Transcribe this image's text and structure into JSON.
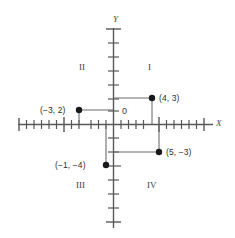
{
  "diagram": {
    "type": "cartesian-coordinate-plane",
    "axes": {
      "x_label": "X",
      "y_label": "Y",
      "origin_label": "0"
    },
    "quadrants": [
      {
        "id": "I",
        "label": "I"
      },
      {
        "id": "II",
        "label": "II"
      },
      {
        "id": "III",
        "label": "III"
      },
      {
        "id": "IV",
        "label": "IV"
      }
    ],
    "points": [
      {
        "label": "(4, 3)",
        "x": 4,
        "y": 3
      },
      {
        "label": "(−3, 2)",
        "x": -3,
        "y": 2
      },
      {
        "label": "(−1, −4)",
        "x": -1,
        "y": -4
      },
      {
        "label": "(5, −3)",
        "x": 5,
        "y": -3
      }
    ],
    "colors": {
      "axis": "#58585a",
      "leader": "#6d6d70",
      "point": "#18181a",
      "text": "#3d3d3f",
      "background": "#ffffff"
    }
  }
}
